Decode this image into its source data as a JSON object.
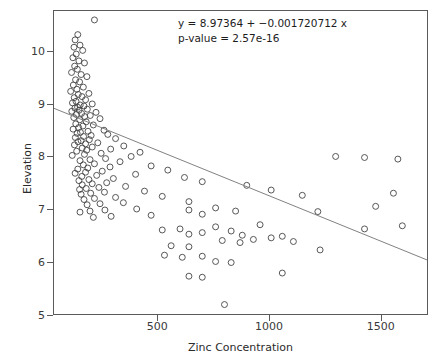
{
  "chart_data": {
    "type": "scatter",
    "title": "",
    "xlabel": "Zinc Concentration",
    "ylabel": "Elevation",
    "xlim": [
      33,
      1711
    ],
    "ylim": [
      5.0,
      10.77
    ],
    "xticks": [
      500,
      1000,
      1500
    ],
    "yticks": [
      5,
      6,
      7,
      8,
      9,
      10
    ],
    "grid": false,
    "legend": null,
    "annotations": [
      "y = 8.97364 + −0.001720712 x",
      "p-value = 2.57e-16"
    ],
    "fit": {
      "intercept": 8.97364,
      "slope": -0.001720712,
      "p_value": "2.57e-16",
      "x_start": 33,
      "x_end": 1711
    },
    "marker": {
      "shape": "open-circle",
      "size": 6,
      "stroke": "#444444",
      "fill": "none"
    },
    "line_color": "#808080",
    "points": [
      [
        215,
        10.6
      ],
      [
        140,
        10.32
      ],
      [
        128,
        10.22
      ],
      [
        150,
        10.12
      ],
      [
        123,
        10.08
      ],
      [
        162,
        10.02
      ],
      [
        133,
        9.95
      ],
      [
        118,
        9.88
      ],
      [
        145,
        9.82
      ],
      [
        170,
        9.78
      ],
      [
        126,
        9.72
      ],
      [
        138,
        9.66
      ],
      [
        112,
        9.6
      ],
      [
        155,
        9.56
      ],
      [
        181,
        9.52
      ],
      [
        130,
        9.46
      ],
      [
        148,
        9.42
      ],
      [
        120,
        9.36
      ],
      [
        165,
        9.32
      ],
      [
        136,
        9.28
      ],
      [
        108,
        9.24
      ],
      [
        190,
        9.2
      ],
      [
        142,
        9.18
      ],
      [
        159,
        9.14
      ],
      [
        124,
        9.12
      ],
      [
        175,
        9.08
      ],
      [
        132,
        9.05
      ],
      [
        116,
        9.02
      ],
      [
        205,
        9.0
      ],
      [
        151,
        8.98
      ],
      [
        168,
        8.96
      ],
      [
        139,
        8.94
      ],
      [
        127,
        8.92
      ],
      [
        183,
        8.9
      ],
      [
        146,
        8.88
      ],
      [
        113,
        8.86
      ],
      [
        222,
        8.84
      ],
      [
        157,
        8.82
      ],
      [
        134,
        8.8
      ],
      [
        196,
        8.78
      ],
      [
        171,
        8.76
      ],
      [
        122,
        8.74
      ],
      [
        240,
        8.72
      ],
      [
        149,
        8.7
      ],
      [
        178,
        8.66
      ],
      [
        131,
        8.62
      ],
      [
        210,
        8.6
      ],
      [
        163,
        8.58
      ],
      [
        144,
        8.55
      ],
      [
        119,
        8.52
      ],
      [
        258,
        8.5
      ],
      [
        186,
        8.48
      ],
      [
        152,
        8.46
      ],
      [
        137,
        8.44
      ],
      [
        275,
        8.42
      ],
      [
        200,
        8.4
      ],
      [
        166,
        8.38
      ],
      [
        129,
        8.36
      ],
      [
        310,
        8.34
      ],
      [
        192,
        8.32
      ],
      [
        155,
        8.3
      ],
      [
        141,
        8.28
      ],
      [
        230,
        8.26
      ],
      [
        175,
        8.24
      ],
      [
        125,
        8.22
      ],
      [
        347,
        8.2
      ],
      [
        205,
        8.18
      ],
      [
        160,
        8.16
      ],
      [
        288,
        8.14
      ],
      [
        180,
        8.12
      ],
      [
        135,
        8.1
      ],
      [
        420,
        8.08
      ],
      [
        245,
        8.06
      ],
      [
        170,
        8.04
      ],
      [
        115,
        8.02
      ],
      [
        380,
        8.0
      ],
      [
        1580,
        7.95
      ],
      [
        1430,
        7.98
      ],
      [
        1300,
        8.0
      ],
      [
        265,
        7.96
      ],
      [
        195,
        7.94
      ],
      [
        150,
        7.92
      ],
      [
        330,
        7.9
      ],
      [
        215,
        7.86
      ],
      [
        165,
        7.84
      ],
      [
        470,
        7.82
      ],
      [
        285,
        7.8
      ],
      [
        185,
        7.78
      ],
      [
        140,
        7.76
      ],
      [
        545,
        7.74
      ],
      [
        250,
        7.72
      ],
      [
        175,
        7.7
      ],
      [
        128,
        7.68
      ],
      [
        400,
        7.66
      ],
      [
        225,
        7.64
      ],
      [
        158,
        7.62
      ],
      [
        620,
        7.6
      ],
      [
        300,
        7.58
      ],
      [
        190,
        7.56
      ],
      [
        145,
        7.54
      ],
      [
        700,
        7.52
      ],
      [
        270,
        7.5
      ],
      [
        205,
        7.48
      ],
      [
        160,
        7.46
      ],
      [
        900,
        7.45
      ],
      [
        355,
        7.43
      ],
      [
        235,
        7.41
      ],
      [
        178,
        7.39
      ],
      [
        148,
        7.37
      ],
      [
        1010,
        7.36
      ],
      [
        440,
        7.34
      ],
      [
        260,
        7.32
      ],
      [
        198,
        7.3
      ],
      [
        155,
        7.28
      ],
      [
        1150,
        7.26
      ],
      [
        520,
        7.24
      ],
      [
        310,
        7.22
      ],
      [
        215,
        7.2
      ],
      [
        168,
        7.18
      ],
      [
        1560,
        7.3
      ],
      [
        640,
        7.14
      ],
      [
        345,
        7.12
      ],
      [
        240,
        7.1
      ],
      [
        182,
        7.08
      ],
      [
        1480,
        7.05
      ],
      [
        760,
        7.02
      ],
      [
        405,
        7.0
      ],
      [
        262,
        6.98
      ],
      [
        195,
        6.96
      ],
      [
        150,
        6.94
      ],
      [
        640,
        6.98
      ],
      [
        850,
        6.96
      ],
      [
        1220,
        6.95
      ],
      [
        1600,
        6.68
      ],
      [
        1430,
        6.62
      ],
      [
        700,
        6.9
      ],
      [
        470,
        6.88
      ],
      [
        290,
        6.86
      ],
      [
        210,
        6.84
      ],
      [
        960,
        6.7
      ],
      [
        760,
        6.66
      ],
      [
        600,
        6.62
      ],
      [
        520,
        6.6
      ],
      [
        830,
        6.58
      ],
      [
        700,
        6.55
      ],
      [
        640,
        6.52
      ],
      [
        880,
        6.5
      ],
      [
        1060,
        6.48
      ],
      [
        1010,
        6.45
      ],
      [
        930,
        6.42
      ],
      [
        790,
        6.4
      ],
      [
        1110,
        6.38
      ],
      [
        870,
        6.36
      ],
      [
        560,
        6.3
      ],
      [
        640,
        6.28
      ],
      [
        1230,
        6.22
      ],
      [
        700,
        6.1
      ],
      [
        530,
        6.12
      ],
      [
        610,
        6.08
      ],
      [
        830,
        5.98
      ],
      [
        760,
        6.0
      ],
      [
        1060,
        5.78
      ],
      [
        700,
        5.7
      ],
      [
        640,
        5.72
      ],
      [
        800,
        5.18
      ]
    ]
  }
}
